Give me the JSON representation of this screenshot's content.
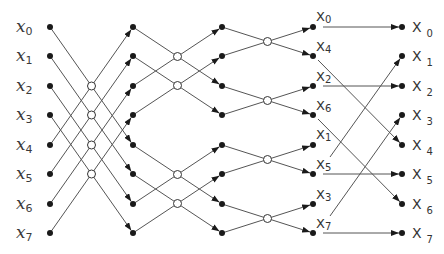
{
  "diagram": {
    "inputs": [
      {
        "base": "x",
        "sub": "0"
      },
      {
        "base": "x",
        "sub": "1"
      },
      {
        "base": "x",
        "sub": "2"
      },
      {
        "base": "x",
        "sub": "3"
      },
      {
        "base": "x",
        "sub": "4"
      },
      {
        "base": "x",
        "sub": "5"
      },
      {
        "base": "x",
        "sub": "6"
      },
      {
        "base": "x",
        "sub": "7"
      }
    ],
    "stage3_outputs": [
      {
        "base": "X",
        "sub": "0"
      },
      {
        "base": "X",
        "sub": "4"
      },
      {
        "base": "X",
        "sub": "2"
      },
      {
        "base": "X",
        "sub": "6"
      },
      {
        "base": "X",
        "sub": "1"
      },
      {
        "base": "X",
        "sub": "5"
      },
      {
        "base": "X",
        "sub": "3"
      },
      {
        "base": "X",
        "sub": "7"
      }
    ],
    "outputs": [
      {
        "base": "X",
        "sub": "0"
      },
      {
        "base": "X",
        "sub": "1"
      },
      {
        "base": "X",
        "sub": "2"
      },
      {
        "base": "X",
        "sub": "3"
      },
      {
        "base": "X",
        "sub": "4"
      },
      {
        "base": "X",
        "sub": "5"
      },
      {
        "base": "X",
        "sub": "6"
      },
      {
        "base": "X",
        "sub": "7"
      }
    ],
    "stages": [
      {
        "name": "stage-1",
        "pairs": [
          [
            0,
            4
          ],
          [
            1,
            5
          ],
          [
            2,
            6
          ],
          [
            3,
            7
          ]
        ]
      },
      {
        "name": "stage-2",
        "pairs": [
          [
            0,
            2
          ],
          [
            1,
            3
          ],
          [
            4,
            6
          ],
          [
            5,
            7
          ]
        ]
      },
      {
        "name": "stage-3",
        "pairs": [
          [
            0,
            1
          ],
          [
            2,
            3
          ],
          [
            4,
            5
          ],
          [
            6,
            7
          ]
        ]
      }
    ],
    "bit_reversal_map": [
      0,
      4,
      2,
      6,
      1,
      5,
      3,
      7
    ],
    "colors": {
      "line": "#555555",
      "node": "#1a1a1a",
      "junction_fill": "#ffffff"
    }
  }
}
